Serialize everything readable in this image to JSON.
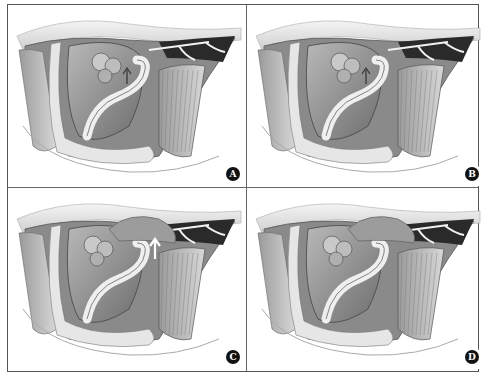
{
  "figure": {
    "panels": [
      {
        "id": "A",
        "label": "A",
        "arrow": "dark-up"
      },
      {
        "id": "B",
        "label": "B",
        "arrow": "dark-up"
      },
      {
        "id": "C",
        "label": "C",
        "arrow": "white-up"
      },
      {
        "id": "D",
        "label": "D",
        "arrow": "none"
      }
    ]
  },
  "colors": {
    "line": "#555555",
    "label_bg": "#111111",
    "label_fg": "#ffffff"
  }
}
